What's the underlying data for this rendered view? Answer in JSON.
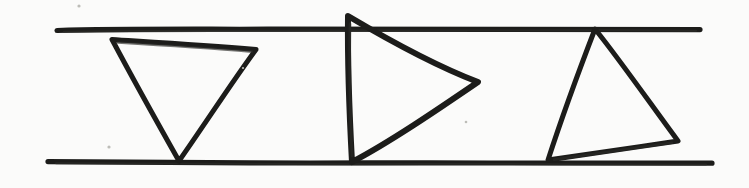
{
  "figure": {
    "medium": "pen-on-paper scan",
    "width": 749,
    "height": 188,
    "background_color": "#fbfbfa",
    "ink_color": "#1c1c1a",
    "ink_color_light": "#2b2b28"
  },
  "chart_data": {
    "type": "diagram",
    "title": "",
    "guides": [
      {
        "name": "top-rule",
        "label": "upper horizontal line",
        "x1": 57,
        "y1": 30,
        "x2": 700,
        "y2": 30,
        "stroke_width": 5
      },
      {
        "name": "bottom-rule",
        "label": "lower horizontal line",
        "x1": 48,
        "y1": 162,
        "x2": 712,
        "y2": 163,
        "stroke_width": 5
      }
    ],
    "shapes": [
      {
        "name": "triangle-down",
        "label": "downward-pointing triangle",
        "orientation": "apex-down",
        "stroke_width": 5,
        "vertices": [
          {
            "x": 113,
            "y": 40
          },
          {
            "x": 256,
            "y": 50
          },
          {
            "x": 178,
            "y": 161
          }
        ]
      },
      {
        "name": "triangle-right",
        "label": "right-pointing triangle",
        "orientation": "apex-right",
        "stroke_width": 6,
        "vertices": [
          {
            "x": 348,
            "y": 16
          },
          {
            "x": 478,
            "y": 82
          },
          {
            "x": 352,
            "y": 162
          }
        ]
      },
      {
        "name": "triangle-tilted",
        "label": "tilted triangle resting on lower line",
        "orientation": "apex-up",
        "stroke_width": 5,
        "vertices": [
          {
            "x": 595,
            "y": 29
          },
          {
            "x": 678,
            "y": 141
          },
          {
            "x": 548,
            "y": 160
          }
        ]
      }
    ],
    "specks": [
      {
        "x": 79,
        "y": 6,
        "r": 1.6
      },
      {
        "x": 109,
        "y": 147,
        "r": 1.6
      },
      {
        "x": 466,
        "y": 122,
        "r": 1.3
      },
      {
        "x": 243,
        "y": 68,
        "r": 1.1
      }
    ]
  }
}
